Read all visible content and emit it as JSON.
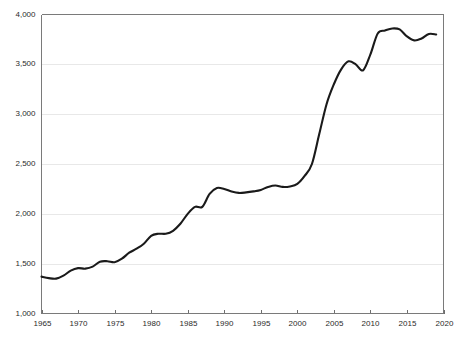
{
  "chart_data": {
    "type": "line",
    "title": "",
    "subtitle": "",
    "xlabel": "",
    "ylabel": "",
    "xlim": [
      1965,
      2020
    ],
    "ylim": [
      1000,
      4000
    ],
    "grid": true,
    "legend": false,
    "legend_position": "none",
    "xticks": [
      1965,
      1970,
      1975,
      1980,
      1985,
      1990,
      1995,
      2000,
      2005,
      2010,
      2015,
      2020
    ],
    "xtick_labels": [
      "1965",
      "1970",
      "1975",
      "1980",
      "1985",
      "1990",
      "1995",
      "2000",
      "2005",
      "2010",
      "2015",
      "2020"
    ],
    "yticks": [
      1000,
      1500,
      2000,
      2500,
      3000,
      3500,
      4000
    ],
    "ytick_labels": [
      "1,000",
      "1,500",
      "2,000",
      "2,500",
      "3,000",
      "3,500",
      "4,000"
    ],
    "series": [
      {
        "name": "series-1",
        "color": "#1a1a1a",
        "x": [
          1965,
          1966,
          1967,
          1968,
          1969,
          1970,
          1971,
          1972,
          1973,
          1974,
          1975,
          1976,
          1977,
          1978,
          1979,
          1980,
          1981,
          1982,
          1983,
          1984,
          1985,
          1986,
          1987,
          1988,
          1989,
          1990,
          1991,
          1992,
          1993,
          1994,
          1995,
          1996,
          1997,
          1998,
          1999,
          2000,
          2001,
          2002,
          2003,
          2004,
          2005,
          2006,
          2007,
          2008,
          2009,
          2010,
          2011,
          2012,
          2013,
          2014,
          2015,
          2016,
          2017,
          2018,
          2019
        ],
        "values": [
          1370,
          1355,
          1350,
          1380,
          1430,
          1455,
          1450,
          1470,
          1520,
          1525,
          1515,
          1550,
          1610,
          1650,
          1700,
          1780,
          1800,
          1800,
          1830,
          1900,
          2000,
          2070,
          2070,
          2200,
          2260,
          2250,
          2225,
          2210,
          2215,
          2225,
          2240,
          2270,
          2285,
          2270,
          2275,
          2300,
          2380,
          2500,
          2800,
          3100,
          3300,
          3450,
          3530,
          3500,
          3440,
          3600,
          3810,
          3840,
          3860,
          3850,
          3780,
          3740,
          3760,
          3805,
          3800
        ]
      }
    ]
  },
  "axes": {
    "x_axis_name": "year-axis",
    "y_axis_name": "value-axis"
  }
}
